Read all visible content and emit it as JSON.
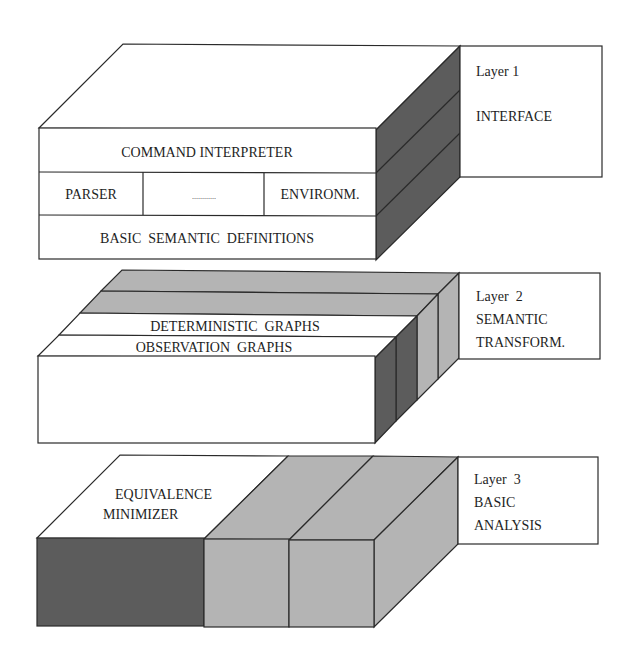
{
  "colors": {
    "background": "#ffffff",
    "stroke": "#2a2a2a",
    "dark_gray": "#5c5c5c",
    "light_gray": "#b4b4b4",
    "white": "#ffffff"
  },
  "layers": [
    {
      "label_title": "Layer 1",
      "label_name": "INTERFACE",
      "rows": {
        "top": "COMMAND INTERPRETER",
        "middle": [
          "PARSER",
          "............",
          "ENVIRONM."
        ],
        "bottom": "BASIC  SEMANTIC  DEFINITIONS"
      }
    },
    {
      "label_title": "Layer  2",
      "label_name_line1": "SEMANTIC",
      "label_name_line2": "TRANSFORM.",
      "strips": [
        "DETERMINISTIC  GRAPHS",
        "OBSERVATION  GRAPHS"
      ]
    },
    {
      "label_title": "Layer  3",
      "label_name_line1": "BASIC",
      "label_name_line2": "ANALYSIS",
      "blocks": [
        "EQUIVALENCE",
        "MINIMIZER"
      ]
    }
  ]
}
